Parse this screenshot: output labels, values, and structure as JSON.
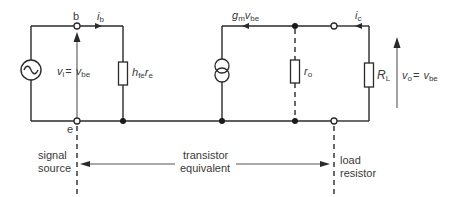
{
  "diagram": {
    "nodes": {
      "base": "b",
      "emitter": "e"
    },
    "currents": {
      "base_current": {
        "main": "i",
        "sub": "b"
      },
      "collector_current": {
        "main": "i",
        "sub": "c"
      },
      "controlled_source": {
        "main": "g",
        "sub": "m",
        "main2": "v",
        "sub2": "be"
      }
    },
    "components": {
      "input_resistance": {
        "main": "h",
        "sub": "fe",
        "main2": "r",
        "sub2": "e"
      },
      "output_resistance": {
        "main": "r",
        "sub": "o"
      },
      "load_resistance": {
        "main": "R",
        "sub": "L"
      }
    },
    "voltages": {
      "input": {
        "main": "v",
        "sub": "i",
        "eq": "=",
        "main2": "v",
        "sub2": "be"
      },
      "output": {
        "main": "v",
        "sub": "o",
        "eq": "=",
        "main2": "v",
        "sub2": "be"
      }
    },
    "regions": {
      "left": {
        "line1": "signal",
        "line2": "source"
      },
      "middle": {
        "line1": "transistor",
        "line2": "equivalent"
      },
      "right": {
        "line1": "load",
        "line2": "resistor"
      }
    }
  }
}
